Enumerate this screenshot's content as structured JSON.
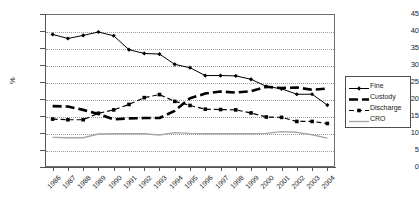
{
  "chart_data": {
    "type": "line",
    "title": "",
    "xlabel": "",
    "ylabel": "%",
    "ylim": [
      0,
      45
    ],
    "ytick_step": 5,
    "grid": true,
    "legend_position": "right",
    "categories": [
      "1986",
      "1987",
      "1988",
      "1989",
      "1990",
      "1991",
      "1992",
      "1993",
      "1994",
      "1995",
      "1996",
      "1997",
      "1998",
      "1999",
      "2000",
      "2001",
      "2002",
      "2003",
      "2004"
    ],
    "yticks": [
      "0",
      "5",
      "10",
      "15",
      "20",
      "25",
      "30",
      "35",
      "40",
      "45"
    ],
    "series": [
      {
        "name": "Fine",
        "style": "solid-diamond",
        "color": "#000000",
        "values": [
          39.0,
          37.8,
          38.7,
          39.7,
          38.6,
          34.5,
          33.4,
          33.2,
          30.2,
          29.2,
          26.9,
          26.9,
          26.8,
          25.8,
          23.7,
          23.0,
          21.4,
          21.4,
          18.2
        ]
      },
      {
        "name": "Custody",
        "style": "thick-dashed",
        "color": "#000000",
        "values": [
          17.9,
          17.8,
          16.8,
          15.6,
          14.0,
          14.3,
          14.4,
          14.4,
          16.5,
          20.2,
          21.6,
          22.2,
          21.9,
          22.3,
          23.6,
          23.2,
          23.4,
          22.7,
          23.1
        ]
      },
      {
        "name": "Discharge",
        "style": "dashed-square",
        "color": "#000000",
        "values": [
          14.1,
          13.9,
          13.9,
          15.8,
          16.8,
          18.4,
          20.4,
          21.3,
          19.3,
          18.1,
          17.0,
          16.9,
          16.8,
          15.9,
          14.7,
          14.6,
          13.4,
          13.4,
          12.8
        ]
      },
      {
        "name": "CRO",
        "style": "solid-gray",
        "color": "#a6a6a6",
        "values": [
          8.7,
          8.6,
          8.6,
          9.7,
          9.8,
          9.8,
          9.8,
          9.4,
          10.1,
          9.9,
          9.8,
          9.8,
          9.8,
          9.8,
          9.9,
          10.4,
          10.2,
          9.5,
          8.5
        ]
      }
    ]
  },
  "legend": {
    "items": [
      {
        "label": "Fine"
      },
      {
        "label": "Custody"
      },
      {
        "label": "Discharge"
      },
      {
        "label": "CRO"
      }
    ]
  }
}
